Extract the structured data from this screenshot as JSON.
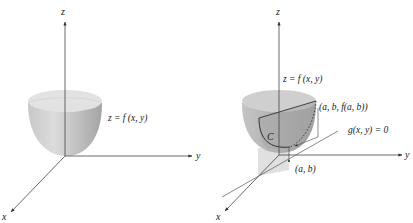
{
  "figures": [
    {
      "name": "surface",
      "axes": {
        "x": "x",
        "y": "y",
        "z": "z"
      },
      "surface_label": "z = f (x, y)"
    },
    {
      "name": "constrained-surface",
      "axes": {
        "x": "x",
        "y": "y",
        "z": "z"
      },
      "surface_label": "z = f (x, y)",
      "curve_label": "C",
      "point_label": "(a, b, f(a, b))",
      "constraint_label": "g(x, y) = 0",
      "base_point_label": "(a, b)"
    }
  ],
  "colors": {
    "surface_light": "#d4d4d4",
    "surface_dark": "#a8a8a8",
    "axis": "#444444",
    "curve": "#333333"
  }
}
